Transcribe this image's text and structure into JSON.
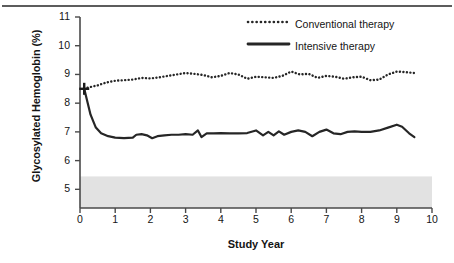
{
  "figure": {
    "top_rule": true,
    "y_axis_title": "Glycosylated Hemoglobin (%)",
    "x_axis_title": "Study Year",
    "normal_band_label": "NORMAL—6.05"
  },
  "legend": {
    "position": "top-right",
    "items": [
      {
        "label": "Conventional therapy",
        "style": "dotted",
        "color": "#262626"
      },
      {
        "label": "Intensive therapy",
        "style": "solid",
        "color": "#262626"
      }
    ]
  },
  "chart_data": {
    "type": "line",
    "title": "",
    "xlabel": "Study Year",
    "ylabel": "Glycosylated Hemoglobin (%)",
    "xlim": [
      0,
      10
    ],
    "ylim": [
      4.35,
      11
    ],
    "xticks": [
      0,
      1,
      2,
      3,
      4,
      5,
      6,
      7,
      8,
      9,
      10
    ],
    "yticks": [
      5,
      6,
      7,
      8,
      9,
      10,
      11
    ],
    "xtick_labels": [
      "0",
      "1",
      "2",
      "3",
      "4",
      "5",
      "6",
      "7",
      "8",
      "9",
      "10"
    ],
    "ytick_labels": [
      "5",
      "6",
      "7",
      "8",
      "9",
      "10",
      "11"
    ],
    "grid": false,
    "legend_position": "upper right",
    "annotations": [
      {
        "text": "NORMAL—6.05",
        "type": "band",
        "y_range": [
          4.35,
          5.45
        ],
        "fill": "#e2e2e2"
      },
      {
        "text": "",
        "type": "marker",
        "marker": "plus",
        "x": 0.12,
        "y": 8.5
      }
    ],
    "series": [
      {
        "name": "Conventional therapy",
        "style": "dotted",
        "color": "#262626",
        "x": [
          0.12,
          0.25,
          0.5,
          0.75,
          1.0,
          1.25,
          1.5,
          1.75,
          2.0,
          2.25,
          2.5,
          2.75,
          3.0,
          3.25,
          3.5,
          3.75,
          4.0,
          4.25,
          4.5,
          4.75,
          5.0,
          5.25,
          5.5,
          5.75,
          6.0,
          6.25,
          6.5,
          6.75,
          7.0,
          7.25,
          7.5,
          7.75,
          8.0,
          8.25,
          8.5,
          8.75,
          9.0,
          9.25,
          9.5
        ],
        "y": [
          8.5,
          8.55,
          8.62,
          8.72,
          8.78,
          8.8,
          8.82,
          8.88,
          8.86,
          8.9,
          8.95,
          9.0,
          9.05,
          9.02,
          8.98,
          8.9,
          8.95,
          9.05,
          9.0,
          8.85,
          8.92,
          8.9,
          8.88,
          8.95,
          9.1,
          9.0,
          9.02,
          8.88,
          8.95,
          8.92,
          8.85,
          8.9,
          8.92,
          8.8,
          8.82,
          9.0,
          9.1,
          9.08,
          9.05
        ]
      },
      {
        "name": "Intensive therapy",
        "style": "solid",
        "color": "#262626",
        "x": [
          0.12,
          0.3,
          0.45,
          0.6,
          0.8,
          1.0,
          1.25,
          1.5,
          1.6,
          1.75,
          1.9,
          2.05,
          2.2,
          2.4,
          2.6,
          2.8,
          3.0,
          3.2,
          3.35,
          3.45,
          3.6,
          3.8,
          4.0,
          4.25,
          4.5,
          4.75,
          5.0,
          5.2,
          5.35,
          5.5,
          5.65,
          5.8,
          6.0,
          6.2,
          6.4,
          6.6,
          6.8,
          7.0,
          7.2,
          7.4,
          7.6,
          7.8,
          8.0,
          8.25,
          8.5,
          8.75,
          9.0,
          9.15,
          9.35,
          9.5
        ],
        "y": [
          8.5,
          7.6,
          7.15,
          6.95,
          6.85,
          6.8,
          6.78,
          6.8,
          6.9,
          6.92,
          6.88,
          6.78,
          6.85,
          6.88,
          6.9,
          6.9,
          6.92,
          6.9,
          7.05,
          6.82,
          6.95,
          6.95,
          6.96,
          6.95,
          6.95,
          6.96,
          7.05,
          6.88,
          7.0,
          6.88,
          7.02,
          6.9,
          7.0,
          7.05,
          7.0,
          6.85,
          7.0,
          7.08,
          6.95,
          6.92,
          7.0,
          7.02,
          7.0,
          7.0,
          7.05,
          7.15,
          7.25,
          7.18,
          6.95,
          6.82
        ]
      }
    ]
  }
}
